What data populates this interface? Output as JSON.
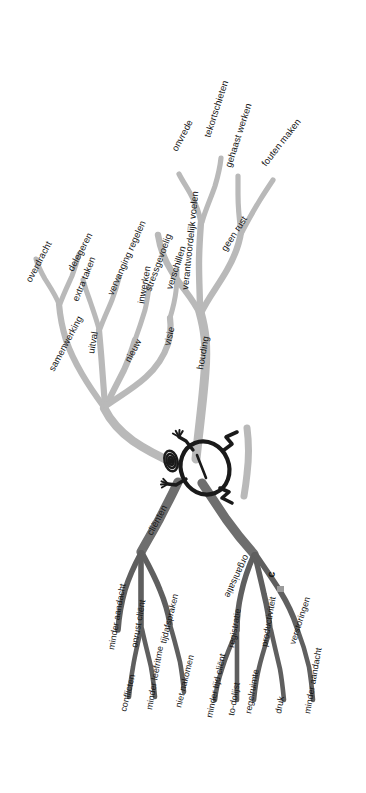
{
  "diagram": {
    "type": "mind-map-tree",
    "language": "nl",
    "orientation": "rotated-90-labels",
    "center": {
      "name": "central-figure",
      "description": "stick figure inside ellipse at trunk junction",
      "spiral": "spiral-icon"
    },
    "colors": {
      "branch_light": "#b9b9b9",
      "branch_mid": "#a8a8a8",
      "branch_dark": "#6e6e6e",
      "branch_darker": "#5f5f5f",
      "figure_stroke": "#1a1a1a",
      "text": "#161616",
      "background": "#ffffff"
    },
    "branches": [
      {
        "id": "houding",
        "label": "houding",
        "tone": "light",
        "children": [
          {
            "id": "stressgevoelig",
            "label": "stressgevoelig",
            "children": []
          },
          {
            "id": "verantwoordelijk-voelen",
            "label": "verantwoordelijk voelen",
            "children": [
              {
                "id": "onvrede",
                "label": "onvrede"
              },
              {
                "id": "tekortschieten",
                "label": "tekortschieten"
              }
            ]
          },
          {
            "id": "geen-rust",
            "label": "geen rust",
            "children": [
              {
                "id": "gehaast-werken",
                "label": "gehaast werken"
              },
              {
                "id": "fouten-maken",
                "label": "fouten maken"
              }
            ]
          }
        ]
      },
      {
        "id": "collegas",
        "label": "collega's",
        "tone": "light",
        "children": [
          {
            "id": "samenwerking",
            "label": "samenwerking",
            "children": [
              {
                "id": "overdracht",
                "label": "overdracht"
              },
              {
                "id": "delegeren",
                "label": "delegeren"
              }
            ]
          },
          {
            "id": "uitval",
            "label": "uitval",
            "children": [
              {
                "id": "extra-taken",
                "label": "extra taken"
              },
              {
                "id": "vervanging-regelen",
                "label": "vervanging regelen"
              }
            ]
          },
          {
            "id": "nieuw",
            "label": "nieuw",
            "children": [
              {
                "id": "inwerken",
                "label": "inwerken"
              }
            ]
          },
          {
            "id": "visie",
            "label": "visie",
            "children": [
              {
                "id": "verschillen",
                "label": "verschillen"
              }
            ]
          }
        ]
      },
      {
        "id": "clienten",
        "label": "cliënten",
        "tone": "dark",
        "children": [
          {
            "id": "minder-aandacht-client",
            "label": "minder aandacht",
            "children": []
          },
          {
            "id": "onrust-client",
            "label": "onrust cliënt",
            "children": [
              {
                "id": "conflicten",
                "label": "conflicten"
              },
              {
                "id": "minder-leefritme",
                "label": "minder leefritme"
              }
            ]
          },
          {
            "id": "tijdsafspraken",
            "label": "tijdafspraken",
            "children": [
              {
                "id": "niet-nakomen",
                "label": "niet nakomen"
              }
            ]
          }
        ]
      },
      {
        "id": "organisatie",
        "label": "organisatie",
        "tone": "dark",
        "children": [
          {
            "id": "registratie",
            "label": "registratie",
            "children": [
              {
                "id": "minder-tijd-client",
                "label": "minder tijd cliënt"
              },
              {
                "id": "to-dolijst",
                "label": "to-dolijst"
              }
            ]
          },
          {
            "id": "productiviteit",
            "label": "productiviteit",
            "children": [
              {
                "id": "regelruimte",
                "label": "regelruimte"
              },
              {
                "id": "druk",
                "label": "druk"
              }
            ]
          },
          {
            "id": "verstoringen",
            "label": "verstoringen",
            "children": [
              {
                "id": "minder-aandacht-org",
                "label": "minder aandacht"
              }
            ]
          }
        ]
      }
    ]
  }
}
